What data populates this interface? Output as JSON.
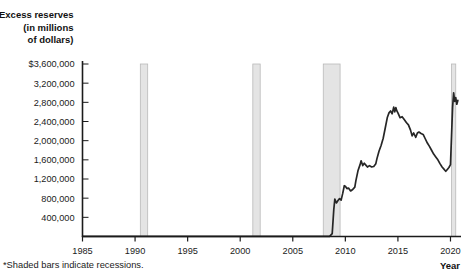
{
  "chart_data": {
    "type": "line",
    "title_lines": [
      "Excess reserves",
      "(in millions",
      "of dollars)"
    ],
    "xlabel": "Year",
    "ylabel": "Excess reserves (in millions of dollars)",
    "xlim": [
      1985,
      2021
    ],
    "ylim": [
      0,
      3600000
    ],
    "grid": false,
    "legend": false,
    "footnote": "*Shaded bars indicate recessions.",
    "xticks": [
      1985,
      1990,
      1995,
      2000,
      2005,
      2010,
      2015,
      2020
    ],
    "xtick_labels": [
      "1985",
      "1990",
      "1995",
      "2000",
      "2005",
      "2010",
      "2015",
      "2020"
    ],
    "yticks": [
      400000,
      800000,
      1200000,
      1600000,
      2000000,
      2400000,
      2800000,
      3200000,
      3600000
    ],
    "ytick_labels": [
      "400,000",
      "800,000",
      "1,200,000",
      "1,600,000",
      "2,000,000",
      "2,400,000",
      "2,800,000",
      "3,200,000",
      "$3,600,000"
    ],
    "line_color": "#262626",
    "recession_fill": "#e4e4e4",
    "recession_stroke": "#b9b9b9",
    "axis_color": "#1b1b1b",
    "recessions": [
      {
        "start": 1990.5,
        "end": 1991.2,
        "label": "1990-91 recession"
      },
      {
        "start": 2001.2,
        "end": 2001.9,
        "label": "2001 recession"
      },
      {
        "start": 2007.9,
        "end": 2009.5,
        "label": "2007-09 recession"
      },
      {
        "start": 2020.1,
        "end": 2020.5,
        "label": "2020 recession"
      }
    ],
    "series": [
      {
        "name": "Excess reserves",
        "points": [
          [
            1985.0,
            1000
          ],
          [
            1986.0,
            1100
          ],
          [
            1987.0,
            1000
          ],
          [
            1988.0,
            1100
          ],
          [
            1989.0,
            1000
          ],
          [
            1990.0,
            1200
          ],
          [
            1991.0,
            1300
          ],
          [
            1992.0,
            1300
          ],
          [
            1993.0,
            1200
          ],
          [
            1994.0,
            1200
          ],
          [
            1995.0,
            1200
          ],
          [
            1996.0,
            1200
          ],
          [
            1997.0,
            1200
          ],
          [
            1998.0,
            1300
          ],
          [
            1999.0,
            1500
          ],
          [
            2000.0,
            1200
          ],
          [
            2001.0,
            1400
          ],
          [
            2001.8,
            2000
          ],
          [
            2002.0,
            1300
          ],
          [
            2003.0,
            1300
          ],
          [
            2004.0,
            1300
          ],
          [
            2005.0,
            1400
          ],
          [
            2006.0,
            1500
          ],
          [
            2007.0,
            1700
          ],
          [
            2008.0,
            2000
          ],
          [
            2008.5,
            3000
          ],
          [
            2008.75,
            60000
          ],
          [
            2008.9,
            560000
          ],
          [
            2009.0,
            780000
          ],
          [
            2009.15,
            700000
          ],
          [
            2009.3,
            750000
          ],
          [
            2009.45,
            790000
          ],
          [
            2009.6,
            760000
          ],
          [
            2009.75,
            900000
          ],
          [
            2009.9,
            1060000
          ],
          [
            2010.0,
            1050000
          ],
          [
            2010.15,
            1000000
          ],
          [
            2010.3,
            1010000
          ],
          [
            2010.5,
            950000
          ],
          [
            2010.7,
            980000
          ],
          [
            2010.9,
            1030000
          ],
          [
            2011.0,
            1160000
          ],
          [
            2011.2,
            1370000
          ],
          [
            2011.4,
            1500000
          ],
          [
            2011.5,
            1580000
          ],
          [
            2011.65,
            1480000
          ],
          [
            2011.8,
            1530000
          ],
          [
            2011.95,
            1490000
          ],
          [
            2012.1,
            1450000
          ],
          [
            2012.3,
            1480000
          ],
          [
            2012.5,
            1450000
          ],
          [
            2012.7,
            1460000
          ],
          [
            2012.9,
            1520000
          ],
          [
            2013.0,
            1620000
          ],
          [
            2013.2,
            1780000
          ],
          [
            2013.4,
            1900000
          ],
          [
            2013.6,
            2050000
          ],
          [
            2013.8,
            2270000
          ],
          [
            2014.0,
            2490000
          ],
          [
            2014.15,
            2580000
          ],
          [
            2014.3,
            2620000
          ],
          [
            2014.45,
            2560000
          ],
          [
            2014.6,
            2700000
          ],
          [
            2014.7,
            2600000
          ],
          [
            2014.8,
            2690000
          ],
          [
            2014.9,
            2620000
          ],
          [
            2015.0,
            2580000
          ],
          [
            2015.2,
            2480000
          ],
          [
            2015.4,
            2500000
          ],
          [
            2015.6,
            2440000
          ],
          [
            2015.8,
            2380000
          ],
          [
            2016.0,
            2330000
          ],
          [
            2016.2,
            2220000
          ],
          [
            2016.35,
            2100000
          ],
          [
            2016.5,
            2160000
          ],
          [
            2016.7,
            2070000
          ],
          [
            2016.85,
            2160000
          ],
          [
            2017.0,
            2180000
          ],
          [
            2017.2,
            2150000
          ],
          [
            2017.4,
            2130000
          ],
          [
            2017.6,
            2040000
          ],
          [
            2017.8,
            1950000
          ],
          [
            2018.0,
            1880000
          ],
          [
            2018.2,
            1800000
          ],
          [
            2018.4,
            1720000
          ],
          [
            2018.6,
            1660000
          ],
          [
            2018.8,
            1600000
          ],
          [
            2019.0,
            1520000
          ],
          [
            2019.2,
            1450000
          ],
          [
            2019.4,
            1400000
          ],
          [
            2019.55,
            1360000
          ],
          [
            2019.7,
            1400000
          ],
          [
            2019.85,
            1440000
          ],
          [
            2020.0,
            1500000
          ],
          [
            2020.1,
            2100000
          ],
          [
            2020.2,
            2700000
          ],
          [
            2020.3,
            3000000
          ],
          [
            2020.4,
            2820000
          ],
          [
            2020.5,
            2900000
          ],
          [
            2020.6,
            2760000
          ],
          [
            2020.7,
            2840000
          ]
        ]
      }
    ]
  }
}
